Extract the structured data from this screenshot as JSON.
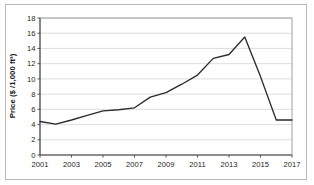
{
  "chart_data": {
    "type": "line",
    "title": "",
    "xlabel": "",
    "ylabel": "Price ($ /1,000 ft³)",
    "x": [
      2001,
      2002,
      2003,
      2004,
      2005,
      2006,
      2007,
      2008,
      2009,
      2010,
      2011,
      2012,
      2013,
      2014,
      2015,
      2016,
      2017
    ],
    "values": [
      4.4,
      4.05,
      4.6,
      5.2,
      5.8,
      5.95,
      6.2,
      7.6,
      8.2,
      9.3,
      10.5,
      12.7,
      13.2,
      15.5,
      10.3,
      4.6,
      4.6
    ],
    "series": [
      {
        "name": "Price",
        "values": [
          4.4,
          4.05,
          4.6,
          5.2,
          5.8,
          5.95,
          6.2,
          7.6,
          8.2,
          9.3,
          10.5,
          12.7,
          13.2,
          15.5,
          10.3,
          4.6,
          4.6
        ],
        "color": "#2b2b2b"
      }
    ],
    "xlim": [
      2001,
      2017
    ],
    "ylim": [
      0,
      18
    ],
    "xticks": [
      2001,
      2003,
      2005,
      2007,
      2009,
      2011,
      2013,
      2015,
      2017
    ],
    "xtick_labels": [
      "2001",
      "2003",
      "2005",
      "2007",
      "2009",
      "2011",
      "2013",
      "2015",
      "2017"
    ],
    "yticks": [
      0,
      2,
      4,
      6,
      8,
      10,
      12,
      14,
      16,
      18
    ],
    "ytick_labels": [
      "0",
      "2",
      "4",
      "6",
      "8",
      "10",
      "12",
      "14",
      "16",
      "18"
    ],
    "grid": "horizontal",
    "legend": "none",
    "gridline_color": "#d0d0d0",
    "axis_color": "#4a4a4a",
    "background_color": "#ffffff"
  }
}
